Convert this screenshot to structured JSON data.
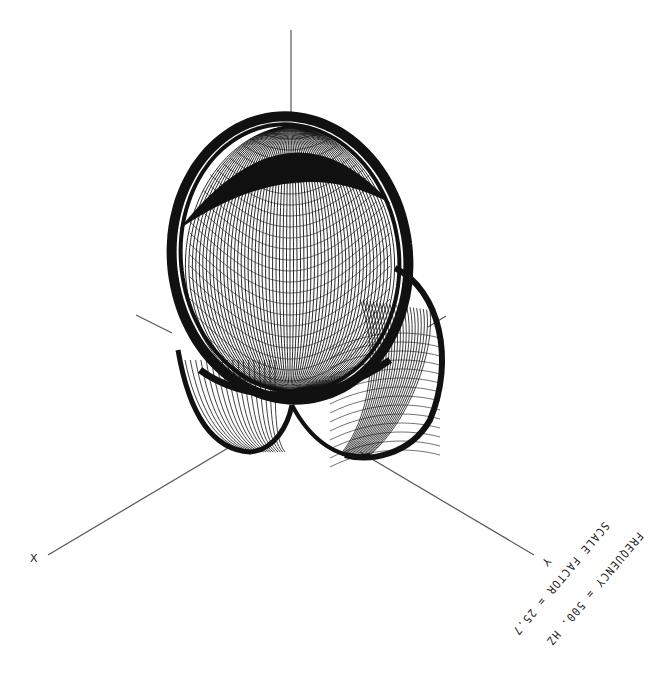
{
  "plot": {
    "type": "3d-wireframe-directivity-pattern",
    "colors": {
      "background": "#ffffff",
      "ink": "#111111",
      "axis": "#555555"
    },
    "axes": {
      "z": {
        "label": "",
        "from": [
          291,
          30
        ],
        "to": [
          291,
          117
        ]
      },
      "x": {
        "label": "X",
        "from": [
          48,
          555
        ],
        "to": [
          290,
          404
        ],
        "label_pos": [
          30,
          553
        ],
        "far_from": [
          136,
          315
        ]
      },
      "y": {
        "label": "Y",
        "from": [
          534,
          555
        ],
        "to": [
          290,
          404
        ],
        "label_pos": [
          543,
          556
        ],
        "far_to": [
          446,
          316
        ]
      }
    },
    "annotations": {
      "frequency_line": "FREQUENCY = 500. HZ",
      "scale_line": "SCALE FACTOR = 25.7"
    }
  }
}
